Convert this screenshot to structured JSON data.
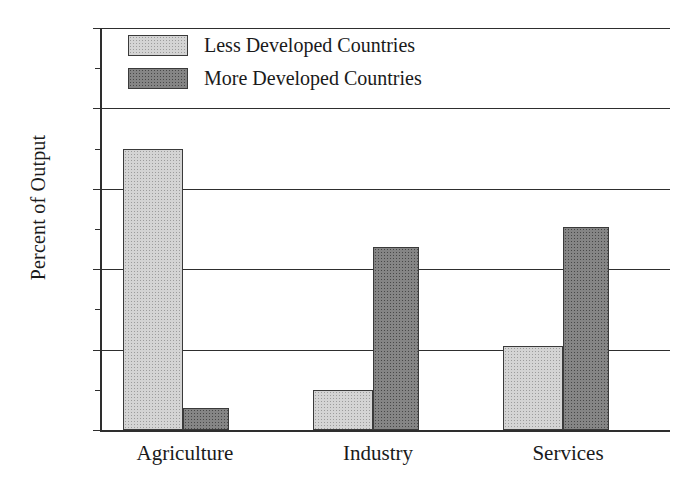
{
  "chart_data": {
    "type": "bar",
    "title": "",
    "xlabel": "",
    "ylabel": "Percent of Output",
    "categories": [
      "Agriculture",
      "Industry",
      "Services"
    ],
    "series": [
      {
        "name": "Less Developed Countries",
        "color": "#d4d4d4",
        "values": [
          70,
          10,
          21
        ]
      },
      {
        "name": "More Developed Countries",
        "color": "#858585",
        "values": [
          5.5,
          45.5,
          50.5
        ]
      }
    ],
    "ylim": [
      0,
      100
    ],
    "ytick_labels": [
      "0",
      "20",
      "40",
      "60",
      "80",
      "100"
    ],
    "ytick_values": [
      0,
      20,
      40,
      60,
      80,
      100
    ],
    "yminor_values": [
      10,
      30,
      50,
      70,
      90
    ],
    "grid": "horizontal",
    "legend_position": "top-left"
  },
  "legend": {
    "items": [
      {
        "label": "Less Developed Countries",
        "swatch": "light-gray-swatch"
      },
      {
        "label": "More Developed Countries",
        "swatch": "dark-gray-swatch"
      }
    ]
  },
  "axis": {
    "y_title": "Percent of Output",
    "y_labels": [
      "100",
      "80",
      "60",
      "40",
      "20",
      "0"
    ],
    "x_labels": [
      "Agriculture",
      "Industry",
      "Services"
    ]
  }
}
